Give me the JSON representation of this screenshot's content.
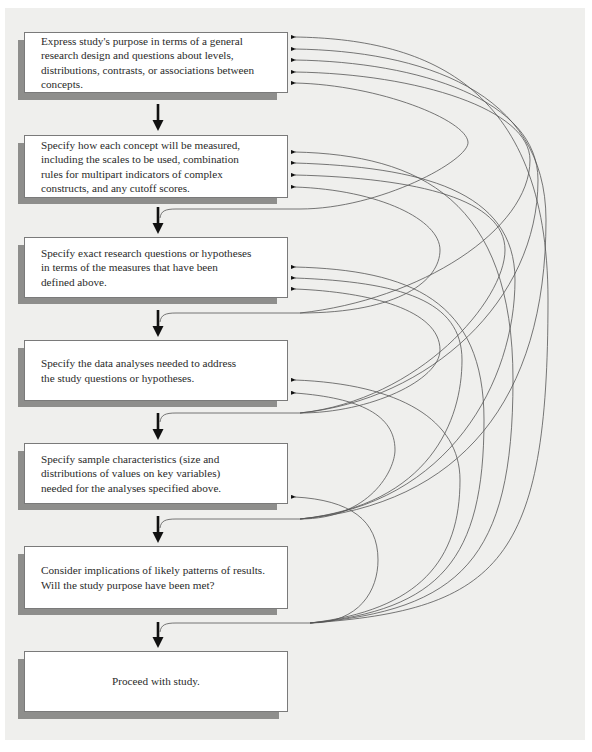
{
  "diagram": {
    "type": "flowchart-with-feedback-loops",
    "steps": [
      {
        "id": 1,
        "text": "Express study's purpose in terms of a general\n  research design and questions about levels,\n  distributions, contrasts, or associations between\n  concepts."
      },
      {
        "id": 2,
        "text": "Specify how each concept will be measured,\n  including the scales to be used, combination\n  rules for multipart indicators of complex\n  constructs, and any cutoff scores."
      },
      {
        "id": 3,
        "text": "Specify exact research questions or hypotheses\n  in terms of the measures that have been\n  defined above."
      },
      {
        "id": 4,
        "text": "Specify the data analyses needed to address\n  the study questions or hypotheses."
      },
      {
        "id": 5,
        "text": "Specify sample characteristics (size and\n  distributions of values on key variables)\n  needed for the analyses specified above."
      },
      {
        "id": 6,
        "text": "Consider implications of likely patterns of results.\n  Will the study purpose have been met?"
      },
      {
        "id": 7,
        "text": "Proceed with study."
      }
    ],
    "feedback_arrows_into_step": {
      "1": 5,
      "2": 4,
      "3": 3,
      "4": 2,
      "5": 1
    },
    "colors": {
      "panel": "#efefed",
      "shadow": "#8e8e8c",
      "box": "#ffffff",
      "line": "#555555",
      "arrow": "#111111"
    }
  }
}
